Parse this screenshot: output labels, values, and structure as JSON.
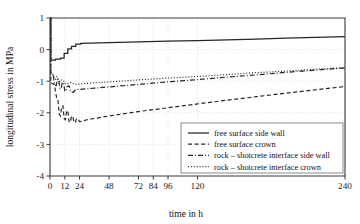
{
  "chart_data": {
    "type": "line",
    "title": "",
    "xlabel": "time in h",
    "ylabel": "longitudinal stress in MPa",
    "xlim": [
      0,
      240
    ],
    "ylim": [
      -4,
      1
    ],
    "xticks": [
      0,
      12,
      24,
      48,
      72,
      84,
      96,
      120,
      240
    ],
    "xtick_labels": [
      "0",
      "12",
      "24",
      "48",
      "72",
      "84",
      "96",
      "120",
      "240"
    ],
    "yticks": [
      1,
      0,
      -1,
      -2,
      -3,
      -4
    ],
    "ytick_labels": [
      "1",
      "0",
      "-1",
      "-2",
      "-3",
      "-4"
    ],
    "grid": true,
    "legend_position": "lower right",
    "series": [
      {
        "name": "free surface side wall",
        "style": "solid",
        "points": [
          [
            0,
            1.0
          ],
          [
            0.6,
            1.0
          ],
          [
            0.6,
            -0.33
          ],
          [
            4.5,
            -0.33
          ],
          [
            4.5,
            -0.3
          ],
          [
            8.5,
            -0.3
          ],
          [
            8.5,
            -0.27
          ],
          [
            11.5,
            -0.27
          ],
          [
            11.5,
            -0.12
          ],
          [
            14.5,
            -0.12
          ],
          [
            14.5,
            0.02
          ],
          [
            17.5,
            0.02
          ],
          [
            17.5,
            0.1
          ],
          [
            21,
            0.1
          ],
          [
            21,
            0.17
          ],
          [
            25,
            0.17
          ],
          [
            25,
            0.2
          ],
          [
            48,
            0.22
          ],
          [
            72,
            0.245
          ],
          [
            96,
            0.265
          ],
          [
            120,
            0.285
          ],
          [
            144,
            0.31
          ],
          [
            168,
            0.335
          ],
          [
            192,
            0.36
          ],
          [
            216,
            0.385
          ],
          [
            240,
            0.41
          ]
        ]
      },
      {
        "name": "free surface crown",
        "style": "dashed",
        "points": [
          [
            0,
            1.0
          ],
          [
            0.6,
            1.0
          ],
          [
            0.6,
            -1.05
          ],
          [
            3.5,
            -1.1
          ],
          [
            5.5,
            -1.55
          ],
          [
            6.5,
            -1.6
          ],
          [
            7.5,
            -2.05
          ],
          [
            8.5,
            -2.1
          ],
          [
            9.5,
            -1.8
          ],
          [
            10.5,
            -1.78
          ],
          [
            11.5,
            -2.18
          ],
          [
            12.5,
            -2.22
          ],
          [
            13.5,
            -1.95
          ],
          [
            14.5,
            -1.93
          ],
          [
            15.5,
            -2.28
          ],
          [
            16.5,
            -2.3
          ],
          [
            17.5,
            -2.12
          ],
          [
            18.5,
            -2.1
          ],
          [
            19.5,
            -2.3
          ],
          [
            20.5,
            -2.31
          ],
          [
            21.5,
            -2.2
          ],
          [
            23,
            -2.19
          ],
          [
            24,
            -2.28
          ],
          [
            26,
            -2.27
          ],
          [
            30,
            -2.22
          ],
          [
            36,
            -2.18
          ],
          [
            48,
            -2.1
          ],
          [
            72,
            -1.96
          ],
          [
            96,
            -1.84
          ],
          [
            120,
            -1.72
          ],
          [
            144,
            -1.6
          ],
          [
            168,
            -1.49
          ],
          [
            192,
            -1.38
          ],
          [
            216,
            -1.27
          ],
          [
            240,
            -1.17
          ]
        ]
      },
      {
        "name": "rock – shotcrete interface side wall",
        "style": "dashdot",
        "points": [
          [
            0,
            1.0
          ],
          [
            0.6,
            1.0
          ],
          [
            0.6,
            -0.8
          ],
          [
            2.5,
            -0.82
          ],
          [
            4.0,
            -1.12
          ],
          [
            5.0,
            -1.14
          ],
          [
            6.0,
            -0.95
          ],
          [
            7.0,
            -0.94
          ],
          [
            8.0,
            -1.22
          ],
          [
            9.0,
            -1.24
          ],
          [
            10.0,
            -1.05
          ],
          [
            11.0,
            -1.04
          ],
          [
            12.0,
            -1.3
          ],
          [
            13.0,
            -1.32
          ],
          [
            14.0,
            -1.16
          ],
          [
            15.5,
            -1.15
          ],
          [
            17.0,
            -1.34
          ],
          [
            19.0,
            -1.35
          ],
          [
            21.0,
            -1.26
          ],
          [
            24,
            -1.26
          ],
          [
            30,
            -1.24
          ],
          [
            36,
            -1.22
          ],
          [
            48,
            -1.18
          ],
          [
            72,
            -1.1
          ],
          [
            96,
            -1.02
          ],
          [
            120,
            -0.95
          ],
          [
            144,
            -0.87
          ],
          [
            168,
            -0.8
          ],
          [
            192,
            -0.72
          ],
          [
            216,
            -0.65
          ],
          [
            240,
            -0.58
          ]
        ]
      },
      {
        "name": "rock – shotcrete interface crown",
        "style": "dotted",
        "points": [
          [
            0,
            1.0
          ],
          [
            0.6,
            1.0
          ],
          [
            0.6,
            -0.72
          ],
          [
            2.0,
            -0.74
          ],
          [
            3.5,
            -0.92
          ],
          [
            4.5,
            -0.94
          ],
          [
            5.5,
            -0.86
          ],
          [
            6.5,
            -0.88
          ],
          [
            7.5,
            -1.0
          ],
          [
            8.5,
            -1.02
          ],
          [
            9.5,
            -0.96
          ],
          [
            11.0,
            -0.98
          ],
          [
            12.5,
            -1.08
          ],
          [
            14.0,
            -1.09
          ],
          [
            16.0,
            -1.04
          ],
          [
            18.0,
            -1.05
          ],
          [
            20.0,
            -1.1
          ],
          [
            24,
            -1.09
          ],
          [
            30,
            -1.07
          ],
          [
            36,
            -1.05
          ],
          [
            48,
            -1.02
          ],
          [
            72,
            -0.96
          ],
          [
            96,
            -0.9
          ],
          [
            120,
            -0.85
          ],
          [
            144,
            -0.79
          ],
          [
            168,
            -0.73
          ],
          [
            192,
            -0.68
          ],
          [
            216,
            -0.62
          ],
          [
            240,
            -0.57
          ]
        ]
      }
    ]
  },
  "legend": {
    "items": [
      {
        "label": "free surface side wall",
        "style": "solid"
      },
      {
        "label": "free surface crown",
        "style": "dashed"
      },
      {
        "label": "rock – shotcrete interface side wall",
        "style": "dashdot"
      },
      {
        "label": "rock – shotcrete interface crown",
        "style": "dotted"
      }
    ]
  },
  "axes": {
    "x_title": "time in h",
    "y_title": "longitudinal stress in MPa"
  }
}
